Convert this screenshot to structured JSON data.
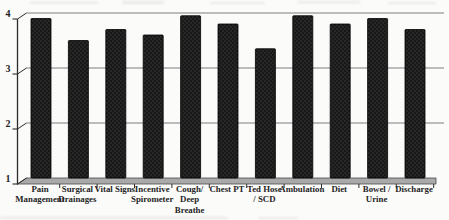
{
  "chart_data": {
    "type": "bar",
    "title": "",
    "xlabel": "",
    "ylabel": "",
    "categories": [
      "Pain Management",
      "Surgical Drainages",
      "Vital Signs",
      "Incentive Spirometer",
      "Cough/ Deep Breathe",
      "Chest PT",
      "Ted Hose / SCD",
      "Ambulation",
      "Diet",
      "Bowel / Urine",
      "Discharge"
    ],
    "category_label_lines": [
      [
        "Pain",
        "Management"
      ],
      [
        "Surgical",
        "Drainages"
      ],
      [
        "Vital Signs"
      ],
      [
        "Incentive",
        "Spirometer"
      ],
      [
        "Cough/",
        "Deep",
        "Breathe"
      ],
      [
        "Chest PT"
      ],
      [
        "Ted Hose",
        "/ SCD"
      ],
      [
        "Ambulation"
      ],
      [
        "Diet"
      ],
      [
        "Bowel /",
        "Urine"
      ],
      [
        "Discharge"
      ]
    ],
    "values": [
      3.9,
      3.5,
      3.7,
      3.6,
      3.95,
      3.8,
      3.35,
      3.95,
      3.8,
      3.9,
      3.7
    ],
    "ylim": [
      1,
      4
    ],
    "yticks": [
      "1",
      "2",
      "3",
      "4"
    ],
    "grid": true,
    "legend_position": "none",
    "colors": {
      "bar_fill": "#181818",
      "bar_speckle": "#424242",
      "bar_stroke": "#000000",
      "gridline": "#7e7e7e",
      "axis": "#2b2b2b",
      "floor_fill": "#a9a9a9",
      "floor_edge": "#4a4a4a",
      "label_text": "#242424",
      "background": "#fbfbfa",
      "scan_smudge": "#dddddb"
    }
  }
}
